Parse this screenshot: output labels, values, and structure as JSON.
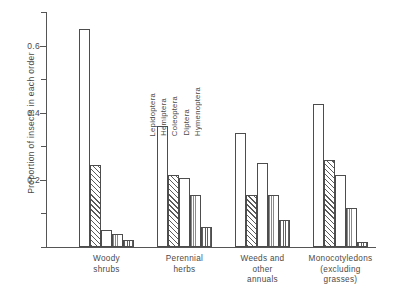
{
  "chart_data": {
    "type": "bar",
    "title": "",
    "xlabel": "",
    "ylabel": "Proportion of insects in each order",
    "ylim": [
      0,
      0.7
    ],
    "yticks": [
      0.0,
      0.1,
      0.2,
      0.3,
      0.4,
      0.5,
      0.6,
      0.7
    ],
    "ytick_labels": [
      "",
      "",
      "0.2",
      "",
      "0.4",
      "",
      "0.6",
      ""
    ],
    "ytick_labels_shown": [
      "0.2",
      "0.4",
      "0.6"
    ],
    "grid": false,
    "legend_position": "inside-upper-middle",
    "categories": [
      "Woody shrubs",
      "Perennial herbs",
      "Weeds and other annuals",
      "Monocotyledons (excluding grasses)"
    ],
    "category_lines": [
      [
        "Woody",
        "shrubs"
      ],
      [
        "Perennial",
        "herbs"
      ],
      [
        "Weeds and",
        "other",
        "annuals"
      ],
      [
        "Monocotyledons",
        "(excluding",
        "grasses)"
      ]
    ],
    "series": [
      {
        "name": "Lepidoptera",
        "pattern": "blank",
        "values": [
          0.65,
          0.36,
          0.34,
          0.425
        ]
      },
      {
        "name": "Hemiptera",
        "pattern": "hatch",
        "values": [
          0.245,
          0.215,
          0.155,
          0.26
        ]
      },
      {
        "name": "Coleoptera",
        "pattern": "blank",
        "values": [
          0.05,
          0.205,
          0.25,
          0.215
        ]
      },
      {
        "name": "Diptera",
        "pattern": "dots",
        "values": [
          0.04,
          0.155,
          0.155,
          0.115
        ]
      },
      {
        "name": "Hymenoptera",
        "pattern": "vlines",
        "values": [
          0.02,
          0.06,
          0.08,
          0.015
        ]
      }
    ]
  },
  "axis": {
    "y_title": "Proportion of insects in each order"
  }
}
